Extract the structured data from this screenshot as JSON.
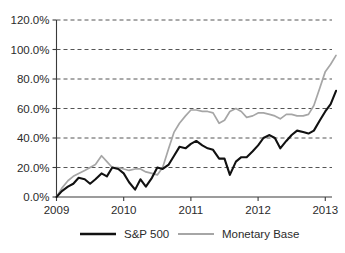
{
  "chart_data": {
    "type": "line",
    "title": "",
    "xlabel": "",
    "ylabel": "",
    "grid": "horizontal-dashed",
    "legend_position": "bottom-center",
    "xlim": [
      2009.0,
      2013.1
    ],
    "ylim": [
      0,
      120
    ],
    "y_ticks": [
      0,
      20,
      40,
      60,
      80,
      100,
      120
    ],
    "y_tick_labels": [
      "0.0%",
      "20.0%",
      "40.0%",
      "60.0%",
      "80.0%",
      "100.0%",
      "120.0%"
    ],
    "x_ticks": [
      2009,
      2010,
      2011,
      2012,
      2013
    ],
    "x_tick_labels": [
      "2009",
      "2010",
      "2011",
      "2012",
      "2013"
    ],
    "colors": {
      "sp500": "#111111",
      "monetary_base": "#a6a6a6",
      "gridline": "#555555",
      "axis": "#3a3a3a",
      "text": "#2b2b2b",
      "background": "#ffffff"
    },
    "series": [
      {
        "name": "S&P 500",
        "color": "#111111",
        "x": [
          2009.0,
          2009.08,
          2009.17,
          2009.25,
          2009.33,
          2009.42,
          2009.5,
          2009.58,
          2009.67,
          2009.75,
          2009.83,
          2009.92,
          2010.0,
          2010.08,
          2010.17,
          2010.25,
          2010.33,
          2010.42,
          2010.5,
          2010.58,
          2010.67,
          2010.75,
          2010.83,
          2010.92,
          2011.0,
          2011.08,
          2011.17,
          2011.25,
          2011.33,
          2011.42,
          2011.5,
          2011.58,
          2011.67,
          2011.75,
          2011.83,
          2011.92,
          2012.0,
          2012.08,
          2012.17,
          2012.25,
          2012.33,
          2012.42,
          2012.5,
          2012.58,
          2012.67,
          2012.75,
          2012.83,
          2012.92,
          2013.0,
          2013.08
        ],
        "values": [
          0,
          4,
          7,
          9,
          13,
          12,
          9,
          12,
          16,
          14,
          20,
          19,
          16,
          10,
          5,
          12,
          7,
          13,
          20,
          19,
          22,
          28,
          34,
          33,
          36,
          38,
          35,
          33,
          32,
          26,
          26,
          15,
          24,
          27,
          27,
          31,
          35,
          40,
          42,
          40,
          33,
          38,
          42,
          45,
          44,
          43,
          45,
          52,
          58,
          63
        ],
        "final_value": 72
      },
      {
        "name": "Monetary Base",
        "color": "#a6a6a6",
        "x": [
          2009.0,
          2009.08,
          2009.17,
          2009.25,
          2009.33,
          2009.42,
          2009.5,
          2009.58,
          2009.67,
          2009.75,
          2009.83,
          2009.92,
          2010.0,
          2010.08,
          2010.17,
          2010.25,
          2010.33,
          2010.42,
          2010.5,
          2010.58,
          2010.67,
          2010.75,
          2010.83,
          2010.92,
          2011.0,
          2011.08,
          2011.17,
          2011.25,
          2011.33,
          2011.42,
          2011.5,
          2011.58,
          2011.67,
          2011.75,
          2011.83,
          2011.92,
          2012.0,
          2012.08,
          2012.17,
          2012.25,
          2012.33,
          2012.42,
          2012.5,
          2012.58,
          2012.67,
          2012.75,
          2012.83,
          2012.92,
          2013.0,
          2013.08
        ],
        "values": [
          0,
          6,
          11,
          14,
          16,
          18,
          20,
          22,
          28,
          24,
          20,
          20,
          19,
          18,
          19,
          19,
          17,
          16,
          15,
          20,
          33,
          44,
          50,
          55,
          59,
          59,
          58,
          58,
          57,
          50,
          52,
          58,
          60,
          58,
          54,
          55,
          57,
          57,
          56,
          55,
          53,
          56,
          56,
          55,
          55,
          56,
          62,
          74,
          85,
          90
        ],
        "final_value": 96
      }
    ],
    "annotations": []
  },
  "legend": {
    "items": [
      {
        "label": "S&P 500",
        "swatch": "solid-black-line"
      },
      {
        "label": "Monetary Base",
        "swatch": "solid-gray-line"
      }
    ]
  }
}
